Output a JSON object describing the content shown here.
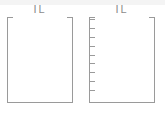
{
  "page": {
    "background_color": "#ffffff",
    "axis_color": "#9a9a9a",
    "title_color": "#8c8c8c",
    "width": 165,
    "height": 114
  },
  "chart_data": [
    {
      "type": "line",
      "panel_id": "left-plot",
      "title": "IL",
      "subtitle": "",
      "xlabel": "",
      "ylabel": "",
      "categories": [],
      "values": [],
      "series": [],
      "grid": false,
      "legend": "none",
      "y_ticks": [],
      "x_ticks": [],
      "notes": "Empty axes frame, no plotted data, no tick marks"
    },
    {
      "type": "line",
      "panel_id": "right-plot",
      "title": "IL",
      "subtitle": "",
      "xlabel": "",
      "ylabel": "",
      "categories": [],
      "values": [],
      "series": [],
      "grid": false,
      "legend": "none",
      "y_ticks": [
        "",
        "",
        "",
        "",
        "",
        "",
        "",
        "",
        ""
      ],
      "x_ticks": [],
      "notes": "Empty axes frame with 9 unlabeled tick marks on the left axis"
    }
  ],
  "panels": {
    "left": {
      "title": "IL",
      "tick_count": 0
    },
    "right": {
      "title": "IL",
      "tick_count": 9
    }
  }
}
